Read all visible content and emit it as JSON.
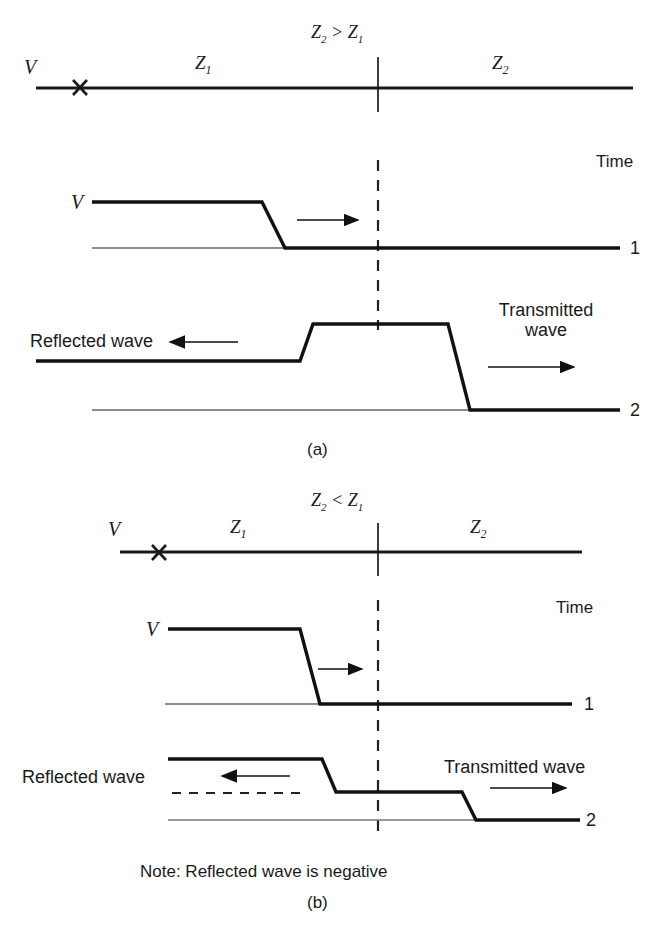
{
  "figure": {
    "title_semantic": "transmission-line-wave-reflection-diagram",
    "panels": [
      {
        "id": "a",
        "caption": "(a)",
        "impedance_relation": "Z₂ > Z₁",
        "relation_parts": {
          "left": "Z",
          "left_sub": "2",
          "op": ">",
          "right": "Z",
          "right_sub": "1"
        },
        "line_diagram": {
          "source_label": "V",
          "fault_marker": "×",
          "segment_left_label": "Z",
          "segment_left_sub": "1",
          "segment_right_label": "Z",
          "segment_right_sub": "2"
        },
        "time_axis_label": "Time",
        "traces": [
          {
            "time_label": "1",
            "level_label": "V",
            "direction_arrow": "right",
            "description": "incident step travelling toward junction"
          },
          {
            "time_label": "2",
            "left_annotation": "Reflected wave",
            "left_arrow": "left",
            "right_annotation_line1": "Transmitted",
            "right_annotation_line2": "wave",
            "right_arrow": "right",
            "description": "positive reflection raises voltage at junction"
          }
        ]
      },
      {
        "id": "b",
        "caption": "(b)",
        "impedance_relation": "Z₂ < Z₁",
        "relation_parts": {
          "left": "Z",
          "left_sub": "2",
          "op": "<",
          "right": "Z",
          "right_sub": "1"
        },
        "line_diagram": {
          "source_label": "V",
          "fault_marker": "×",
          "segment_left_label": "Z",
          "segment_left_sub": "1",
          "segment_right_label": "Z",
          "segment_right_sub": "2"
        },
        "time_axis_label": "Time",
        "traces": [
          {
            "time_label": "1",
            "level_label": "V",
            "direction_arrow": "right",
            "description": "incident step travelling toward junction"
          },
          {
            "time_label": "2",
            "left_annotation": "Reflected wave",
            "left_arrow": "left",
            "right_annotation": "Transmitted wave",
            "right_arrow": "right",
            "description": "negative reflection lowers voltage at junction"
          }
        ],
        "note": "Note: Reflected wave is negative"
      }
    ],
    "colors": {
      "ink": "#1a1a1a",
      "wave_stroke": "#111111",
      "baseline_stroke": "#555555",
      "dashed_stroke": "#222222",
      "background": "#ffffff"
    }
  }
}
